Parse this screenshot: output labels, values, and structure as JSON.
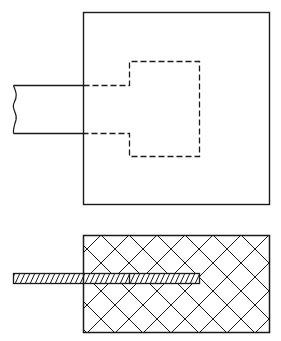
{
  "figure": {
    "width": 281,
    "height": 341,
    "background": "#ffffff",
    "stroke": "#1a1a1a",
    "top_view": {
      "description": "Plan view: strip inserted into square block, embedded portion shown dashed",
      "outer_square": {
        "x": 83,
        "y": 12,
        "w": 186,
        "h": 193
      },
      "strip": {
        "x_start": 13,
        "y_top": 85,
        "y_bottom": 133,
        "enters_at_x": 83
      },
      "embedded_outline_dashed": {
        "notch_x": 129,
        "x_right": 199,
        "y_top": 61,
        "y_bottom": 156
      }
    },
    "section_view": {
      "description": "Section view: crosshatched block with hatched plate embedded",
      "block": {
        "x": 83,
        "y": 235,
        "w": 186,
        "h": 98,
        "hatch": "crosshatch-45",
        "hatch_spacing": 28
      },
      "plate": {
        "x_start": 13,
        "x_end": 199,
        "y_top": 273,
        "y_bottom": 284,
        "divider_x": 129,
        "hatch": "diagonal",
        "hatch_spacing": 5
      }
    }
  }
}
